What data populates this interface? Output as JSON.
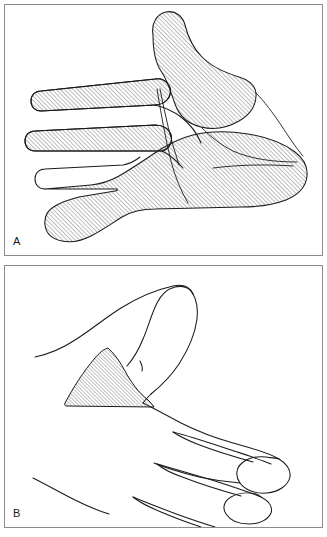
{
  "figure": {
    "kind": "anatomical-line-drawing",
    "background_color": "#ffffff",
    "border_color": "#8c8c8c",
    "ink_color": "#1a1a1a",
    "hatch_color": "#555555"
  },
  "panels": [
    {
      "id": "A",
      "label": "A",
      "name": "panel-a",
      "content": "Dorsal view of hand with large hatched region covering thumb, index/middle/ring/little fingers and the dorsum of the hand",
      "hatched_regions": 4,
      "hatch_angle_degrees": 45,
      "hatch_spacing_px": 2
    },
    {
      "id": "B",
      "label": "B",
      "name": "panel-b",
      "content": "Radial side view of hand and thumb with a small hatched triangular region in the first web space",
      "hatched_regions": 1,
      "hatch_angle_degrees": 45,
      "hatch_spacing_px": 2
    }
  ],
  "colors": {
    "ink": "#1a1a1a",
    "border": "#8c8c8c",
    "hatch": "#555555",
    "paper": "#ffffff"
  }
}
